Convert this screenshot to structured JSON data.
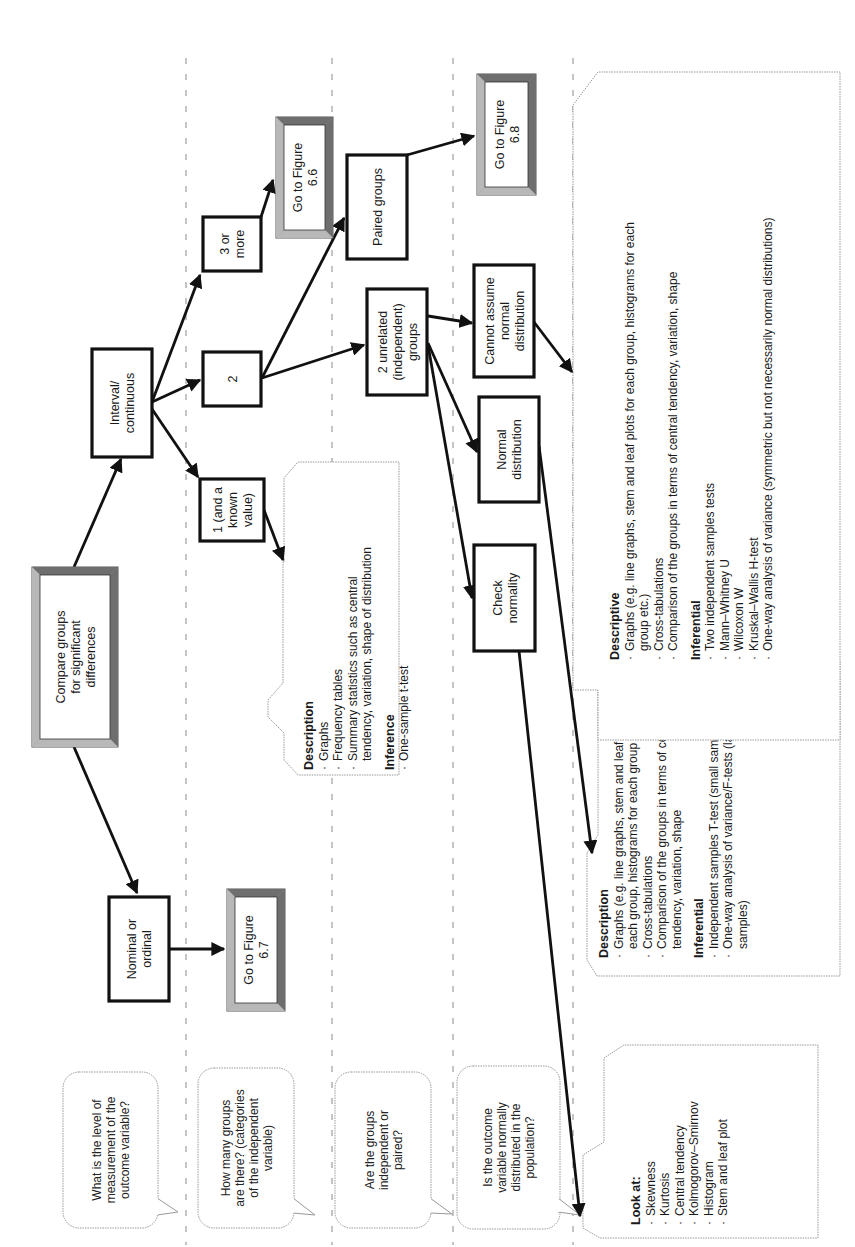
{
  "questions": [
    {
      "id": "q-level",
      "lines": [
        "What is the level of",
        "measurement of the",
        "outcome variable?"
      ]
    },
    {
      "id": "q-groups",
      "lines": [
        "How many groups",
        "are there? (categories",
        "of the independent",
        "variable)"
      ]
    },
    {
      "id": "q-paired",
      "lines": [
        "Are the groups",
        "independent or",
        "paired?"
      ]
    },
    {
      "id": "q-normal",
      "lines": [
        "Is the outcome",
        "variable normally",
        "distributed in the",
        "population?"
      ]
    }
  ],
  "nodes": {
    "start": {
      "lines": [
        "Compare groups",
        "for significant",
        "differences"
      ],
      "style": "bevel"
    },
    "nominal": {
      "lines": [
        "Nominal or",
        "ordinal"
      ],
      "style": "plain"
    },
    "fig67": {
      "lines": [
        "Go to Figure",
        "6.7"
      ],
      "style": "bevel"
    },
    "interval": {
      "lines": [
        "Interval/",
        "continuous"
      ],
      "style": "plain"
    },
    "one": {
      "lines": [
        "1 (and a",
        "known",
        "value)"
      ],
      "style": "plain"
    },
    "two": {
      "lines": [
        "2"
      ],
      "style": "plain"
    },
    "three": {
      "lines": [
        "3 or",
        "more"
      ],
      "style": "plain"
    },
    "fig66": {
      "lines": [
        "Go to Figure",
        "6.6"
      ],
      "style": "bevel"
    },
    "unrelated": {
      "lines": [
        "2 unrelated",
        "(independent)",
        "groups"
      ],
      "style": "plain"
    },
    "paired": {
      "lines": [
        "Paired groups"
      ],
      "style": "plain"
    },
    "fig68": {
      "lines": [
        "Go to Figure",
        "6.8"
      ],
      "style": "bevel"
    },
    "check": {
      "lines": [
        "Check",
        "normality"
      ],
      "style": "plain"
    },
    "normal": {
      "lines": [
        "Normal",
        "distribution"
      ],
      "style": "plain"
    },
    "notnormal": {
      "lines": [
        "Cannot assume",
        "normal",
        "distribution"
      ],
      "style": "plain"
    }
  },
  "panels": {
    "one_sample": {
      "sections": [
        {
          "heading": "Description",
          "items": [
            [
              "Graphs"
            ],
            [
              "Frequency tables"
            ],
            [
              "Summary statistics such as central",
              "tendency, variation, shape of distribution"
            ]
          ]
        },
        {
          "heading": "Inference",
          "items": [
            [
              "One-sample t-test"
            ]
          ]
        }
      ]
    },
    "parametric": {
      "sections": [
        {
          "heading": "Description",
          "items": [
            [
              "Graphs (e.g. line graphs, stem and leaf plots for",
              "each group, histograms for each group etc.)"
            ],
            [
              "Cross-tabulations"
            ],
            [
              "Comparison of the groups in terms of central",
              "tendency, variation, shape"
            ]
          ]
        },
        {
          "heading": "Inferential",
          "items": [
            [
              "Independent samples T-test (small samples)"
            ],
            [
              "One-way analysis of variance/F-tests (larger",
              "samples)"
            ]
          ]
        }
      ]
    },
    "nonparametric": {
      "sections": [
        {
          "heading": "Descriptive",
          "items": [
            [
              "Graphs (e.g. line graphs, stem and leaf plots for each group, histograms for each",
              "group etc.)"
            ],
            [
              "Cross-tabulations"
            ],
            [
              "Comparison of the groups in terms of central tendency, variation, shape"
            ]
          ]
        },
        {
          "heading": "Inferential",
          "items": [
            [
              "Two independent samples tests"
            ],
            [
              "Mann–Whitney U"
            ],
            [
              "Wilcoxon W"
            ],
            [
              "Kruskal–Wallis H-test"
            ],
            [
              "One-way analysis of variance (symmetric but not necessarily normal distributions)"
            ]
          ]
        }
      ]
    },
    "look_at": {
      "sections": [
        {
          "heading": "Look at:",
          "items": [
            [
              "Skewness"
            ],
            [
              "Kurtosis"
            ],
            [
              "Central tendency"
            ],
            [
              "Kolmogorov–Smirnov"
            ],
            [
              "Histogram"
            ],
            [
              "Stem and leaf plot"
            ]
          ]
        }
      ]
    }
  },
  "colors": {
    "bevel_dark": "#6e6e6e",
    "bevel_mid": "#9a9a9a",
    "bevel_light": "#b8b8b8",
    "line": "#111111",
    "dash": "#888888"
  }
}
